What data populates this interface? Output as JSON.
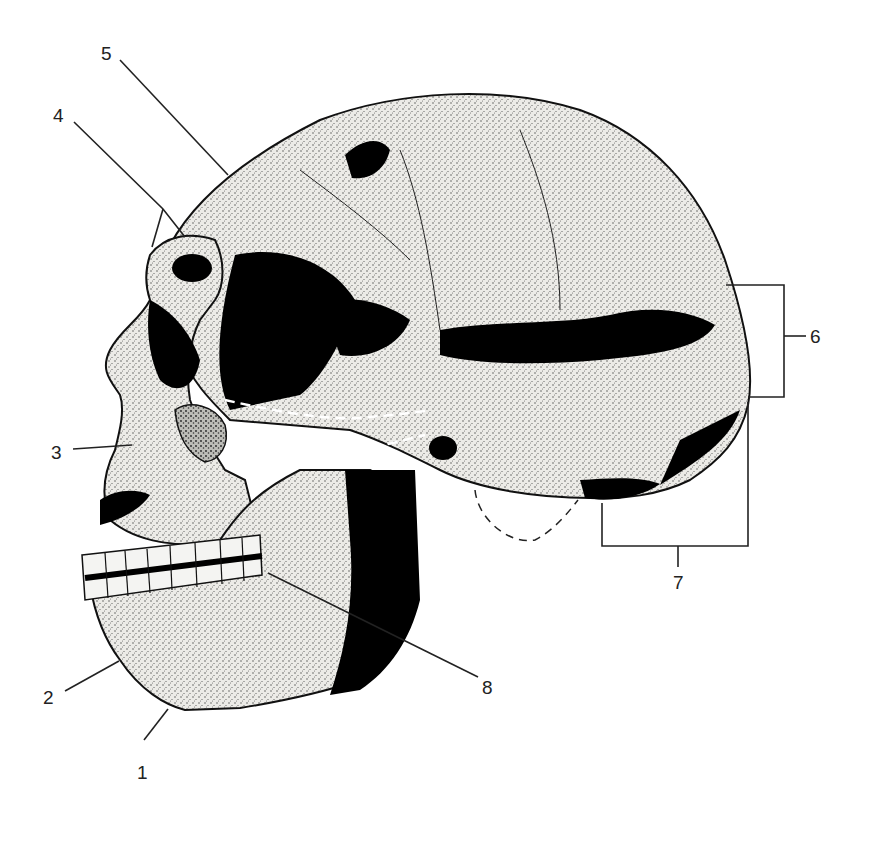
{
  "figure": {
    "colors": {
      "background": "#ffffff",
      "ink": "#1a1a1a",
      "bone": "#e9e9e6",
      "shadow": "#000000",
      "leader": "#222222"
    },
    "labels": [
      {
        "id": "1",
        "text": "1"
      },
      {
        "id": "2",
        "text": "2"
      },
      {
        "id": "3",
        "text": "3"
      },
      {
        "id": "4",
        "text": "4"
      },
      {
        "id": "5",
        "text": "5"
      },
      {
        "id": "6",
        "text": "6"
      },
      {
        "id": "7",
        "text": "7"
      },
      {
        "id": "8",
        "text": "8"
      }
    ]
  }
}
